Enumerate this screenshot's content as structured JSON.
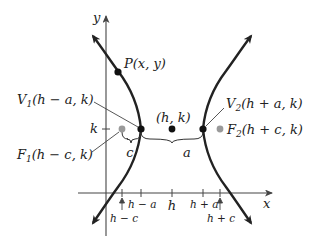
{
  "diagram": {
    "type": "hyperbola-horizontal-transverse-axis",
    "axes": {
      "x_label": "x",
      "y_label": "y",
      "k_label": "k"
    },
    "points": {
      "P": {
        "label": "P(x, y)"
      },
      "center": {
        "label": "(h, k)"
      },
      "V1": {
        "letter": "V",
        "sub": "1",
        "coords": "(h − a, k)"
      },
      "V2": {
        "letter": "V",
        "sub": "2",
        "coords": "(h + a, k)"
      },
      "F1": {
        "letter": "F",
        "sub": "1",
        "coords": "(h − c, k)"
      },
      "F2": {
        "letter": "F",
        "sub": "2",
        "coords": "(h + c, k)"
      }
    },
    "braces": {
      "c": "c",
      "a": "a"
    },
    "x_ticks": {
      "h_minus_c": "h − c",
      "h_minus_a": "h − a",
      "h": "h",
      "h_plus_a": "h + a",
      "h_plus_c": "h + c"
    },
    "colors": {
      "curve": "#222222",
      "vertex": "#111111",
      "focus": "#9a9a9a",
      "axis": "#444444"
    }
  }
}
